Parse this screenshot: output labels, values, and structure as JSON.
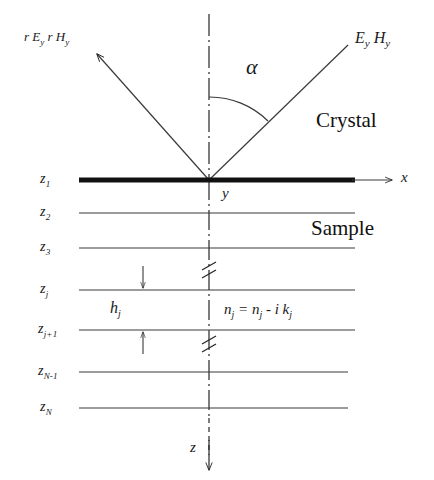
{
  "figure": {
    "type": "optical-multilayer-schematic",
    "width": 434,
    "height": 480,
    "background_color": "#ffffff",
    "line_color": "#262626",
    "text_color": "#1a1a1a"
  },
  "rays": {
    "reflected_label_prefix": "r E",
    "reflected_label": "r E",
    "reflected_sub_1": "y",
    "reflected_label_2": "r H",
    "reflected_sub_2": "y",
    "incident_label_1": "E",
    "incident_sub_1": "y",
    "incident_label_2": "H",
    "incident_sub_2": "y",
    "angle_label": "α"
  },
  "regions": {
    "upper": "Crystal",
    "lower": "Sample"
  },
  "axes": {
    "x_label": "x",
    "y_label": "y",
    "z_label": "z"
  },
  "interfaces": [
    {
      "label": "z",
      "sub": "1",
      "y": 180,
      "thick": true
    },
    {
      "label": "z",
      "sub": "2",
      "y": 213,
      "thick": false
    },
    {
      "label": "z",
      "sub": "3",
      "y": 248,
      "thick": false
    },
    {
      "label": "z",
      "sub": "j",
      "y": 290,
      "thick": false
    },
    {
      "label": "z",
      "sub": "j+1",
      "y": 330,
      "thick": false
    },
    {
      "label": "z",
      "sub": "N-1",
      "y": 372,
      "thick": false
    },
    {
      "label": "z",
      "sub": "N",
      "y": 408,
      "thick": false
    }
  ],
  "layer_annotation": {
    "thickness_label": "h",
    "thickness_sub": "j",
    "index_formula": "n",
    "index_sub_1": "j",
    "index_eq": " = n",
    "index_sub_2": "j",
    "index_minus": " - i k",
    "index_sub_3": "j"
  }
}
